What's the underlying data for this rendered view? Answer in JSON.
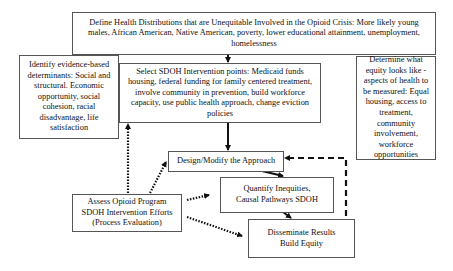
{
  "diagram": {
    "nodes": {
      "define": {
        "label": "Define Health Distributions that are Unequitable Involved in the Opioid Crisis: More likely young males, African American, Native American, poverty, lower educational attainment, unemployment, homelessness"
      },
      "identify": {
        "label": "Identify evidence-based determinants: Social and structural. Economic opportunity, social cohesion, racial disadvantage, life satisfaction"
      },
      "select": {
        "label": "Select SDOH Intervention points: Medicaid funds housing, federal funding for family centered treatment, involve community in prevention, build workforce capacity, use public health approach, change eviction policies"
      },
      "determine": {
        "label": "Determine what equity looks like - aspects of health to be measured: Equal housing, access to treatment, community involvement, workforce opportunities"
      },
      "design": {
        "label": "Design/Modify the Approach"
      },
      "quantify": {
        "label": "Quantify Inequities, Causal Pathways SDOH"
      },
      "disseminate": {
        "label": "Disseminate Results Build Equity"
      },
      "assess": {
        "label": "Assess Opioid Program SDOH Intervention Efforts (Process Evaluation)"
      }
    },
    "edges": [
      {
        "from": "define",
        "to": "select",
        "style": "solid"
      },
      {
        "from": "select",
        "to": "design",
        "style": "solid"
      },
      {
        "from": "design",
        "to": "quantify",
        "style": "solid"
      },
      {
        "from": "quantify",
        "to": "disseminate",
        "style": "solid"
      },
      {
        "from": "disseminate",
        "to": "design",
        "style": "dashed"
      },
      {
        "from": "assess",
        "to": "select",
        "style": "dotted"
      },
      {
        "from": "assess",
        "to": "design",
        "style": "dotted"
      },
      {
        "from": "assess",
        "to": "quantify",
        "style": "dotted"
      },
      {
        "from": "assess",
        "to": "disseminate",
        "style": "dotted"
      }
    ]
  }
}
